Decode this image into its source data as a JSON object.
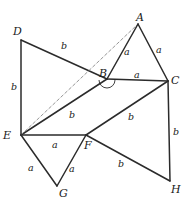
{
  "figure": {
    "background_color": "#ffffff",
    "stroke_color": "#2b2b2b",
    "dashed_stroke_color": "#8a8a8a",
    "text_color": "#1a1a1a",
    "width": 190,
    "height": 212
  },
  "vertices": [
    {
      "id": "A",
      "label": "A",
      "x": 138,
      "y": 24,
      "label_x": 136,
      "label_y": 12
    },
    {
      "id": "B",
      "label": "B",
      "x": 107,
      "y": 79,
      "label_x": 99,
      "label_y": 68
    },
    {
      "id": "C",
      "label": "C",
      "x": 168,
      "y": 81,
      "label_x": 171,
      "label_y": 75
    },
    {
      "id": "D",
      "label": "D",
      "x": 21,
      "y": 40,
      "label_x": 13,
      "label_y": 26
    },
    {
      "id": "E",
      "label": "E",
      "x": 21,
      "y": 135,
      "label_x": 3,
      "label_y": 130
    },
    {
      "id": "F",
      "label": "F",
      "x": 86,
      "y": 135,
      "label_x": 84,
      "label_y": 140
    },
    {
      "id": "G",
      "label": "G",
      "x": 57,
      "y": 186,
      "label_x": 59,
      "label_y": 188
    },
    {
      "id": "H",
      "label": "H",
      "x": 170,
      "y": 181,
      "label_x": 171,
      "label_y": 184
    }
  ],
  "edges": [
    {
      "id": "DB",
      "from": "D",
      "to": "B",
      "style": "solid"
    },
    {
      "id": "DE",
      "from": "D",
      "to": "E",
      "style": "solid"
    },
    {
      "id": "EB",
      "from": "E",
      "to": "B",
      "style": "solid"
    },
    {
      "id": "EA",
      "from": "E",
      "to": "A",
      "style": "dashed"
    },
    {
      "id": "AB",
      "from": "A",
      "to": "B",
      "style": "solid"
    },
    {
      "id": "AC",
      "from": "A",
      "to": "C",
      "style": "solid"
    },
    {
      "id": "BC",
      "from": "B",
      "to": "C",
      "style": "solid"
    },
    {
      "id": "EF",
      "from": "E",
      "to": "F",
      "style": "solid"
    },
    {
      "id": "FC",
      "from": "F",
      "to": "C",
      "style": "solid"
    },
    {
      "id": "EG",
      "from": "E",
      "to": "G",
      "style": "solid"
    },
    {
      "id": "FG",
      "from": "F",
      "to": "G",
      "style": "solid"
    },
    {
      "id": "FH",
      "from": "F",
      "to": "H",
      "style": "solid"
    },
    {
      "id": "CH",
      "from": "C",
      "to": "H",
      "style": "solid"
    }
  ],
  "edge_labels": [
    {
      "id": "label-DB",
      "edge": "DB",
      "text": "b",
      "x": 61,
      "y": 41
    },
    {
      "id": "label-DE",
      "edge": "DE",
      "text": "b",
      "x": 11,
      "y": 82
    },
    {
      "id": "label-EB",
      "edge": "EB",
      "text": "b",
      "x": 69,
      "y": 110
    },
    {
      "id": "label-AB",
      "edge": "AB",
      "text": "a",
      "x": 124,
      "y": 47
    },
    {
      "id": "label-AC",
      "edge": "AC",
      "text": "a",
      "x": 156,
      "y": 45
    },
    {
      "id": "label-BC",
      "edge": "BC",
      "text": "a",
      "x": 134,
      "y": 70
    },
    {
      "id": "label-EF",
      "edge": "EF",
      "text": "a",
      "x": 52,
      "y": 140
    },
    {
      "id": "label-FC",
      "edge": "FC",
      "text": "b",
      "x": 128,
      "y": 112
    },
    {
      "id": "label-EG",
      "edge": "EG",
      "text": "a",
      "x": 28,
      "y": 163
    },
    {
      "id": "label-FG",
      "edge": "FG",
      "text": "a",
      "x": 69,
      "y": 164
    },
    {
      "id": "label-FH",
      "edge": "FH",
      "text": "b",
      "x": 118,
      "y": 159
    },
    {
      "id": "label-CH",
      "edge": "CH",
      "text": "b",
      "x": 173,
      "y": 127
    }
  ],
  "angle_marks": [
    {
      "id": "angle-at-B",
      "at": "B",
      "x": 107,
      "y": 80,
      "radius": 8
    }
  ]
}
